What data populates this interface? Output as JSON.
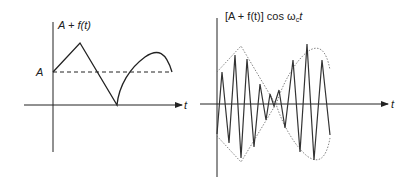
{
  "left_plot": {
    "y_label": "A + f(t)",
    "x_label": "t",
    "level_label": "A",
    "description": "Message signal offset by constant A: linear ramp up, linear ramp down to zero, then arc up and back toward A"
  },
  "right_plot": {
    "y_label_prefix": "[A + f(t)] cos ω",
    "y_label_sub": "c",
    "y_label_suffix": "t",
    "x_label": "t",
    "description": "Amplitude-modulated carrier with dotted envelope following A + f(t)"
  },
  "colors": {
    "line": "#222222",
    "envelope": "#777777"
  }
}
